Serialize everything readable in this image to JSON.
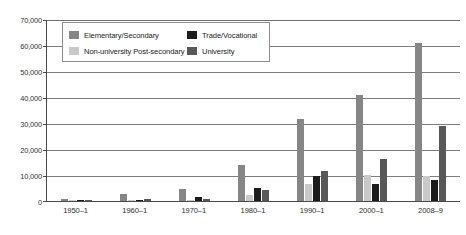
{
  "chart_data": {
    "type": "bar",
    "title": "",
    "xlabel": "",
    "ylabel": "",
    "ylim": [
      0,
      70000
    ],
    "ytick_step": 10000,
    "ytick_labels": [
      "70,000",
      "60,000",
      "50,000",
      "40,000",
      "30,000",
      "20,000",
      "10,000",
      "0"
    ],
    "ytick_values": [
      70000,
      60000,
      50000,
      40000,
      30000,
      20000,
      10000,
      0
    ],
    "grid": true,
    "grid_axis": "y",
    "legend_position": "upper-left-inside",
    "categories": [
      "1950–1",
      "1960–1",
      "1970–1",
      "1980–1",
      "1990–1",
      "2000–1",
      "2008–9"
    ],
    "series": [
      {
        "name": "Elementary/Secondary",
        "color": "#868686",
        "values": [
          700,
          2800,
          4700,
          14000,
          31500,
          40800,
          60600
        ]
      },
      {
        "name": "Non-university Post-secondary",
        "color": "#c9c9c9",
        "values": [
          100,
          200,
          300,
          2200,
          6400,
          10000,
          9700
        ]
      },
      {
        "name": "Trade/Vocational",
        "color": "#1c1c1c",
        "values": [
          400,
          500,
          1500,
          5000,
          9500,
          6500,
          8200
        ]
      },
      {
        "name": "University",
        "color": "#585858",
        "values": [
          200,
          800,
          700,
          4300,
          11500,
          16000,
          28800
        ]
      }
    ]
  },
  "legend": {
    "items": [
      {
        "label": "Elementary/Secondary",
        "color": "#868686"
      },
      {
        "label": "Trade/Vocational",
        "color": "#1c1c1c"
      },
      {
        "label": "Non-university Post-secondary",
        "color": "#c9c9c9"
      },
      {
        "label": "University",
        "color": "#585858"
      }
    ]
  }
}
